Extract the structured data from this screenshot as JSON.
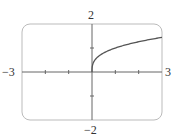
{
  "chart_data": {
    "type": "line",
    "title": "",
    "xlabel": "",
    "ylabel": "",
    "xlim": [
      -3,
      3
    ],
    "ylim": [
      -2,
      2
    ],
    "grid": false,
    "x_tick_labels": [
      "-3",
      "3"
    ],
    "y_tick_labels": [
      "2",
      "-2"
    ],
    "x_ticks": [
      -2,
      -1,
      1,
      2
    ],
    "y_ticks": [
      -1,
      1
    ],
    "series": [
      {
        "name": "y = cube root of x",
        "x": [
          0,
          0.01,
          0.05,
          0.1,
          0.25,
          0.5,
          1,
          1.5,
          2,
          2.5,
          3
        ],
        "values": [
          0,
          0.215,
          0.368,
          0.464,
          0.63,
          0.794,
          1.0,
          1.145,
          1.26,
          1.357,
          1.442
        ]
      }
    ]
  },
  "labels": {
    "x_min": "−3",
    "x_max": "3",
    "y_max": "2",
    "y_min": "−2"
  },
  "colors": {
    "frame": "#bbbbbb",
    "axis": "#666666",
    "curve": "#555555"
  }
}
